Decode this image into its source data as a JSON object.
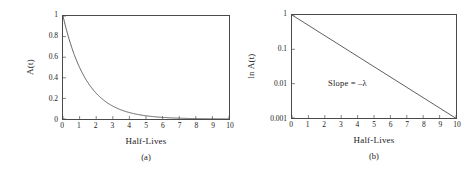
{
  "figure": {
    "background_color": "#ffffff",
    "line_color": "#4a4a4a",
    "text_color": "#1a1a1a"
  },
  "chart_data": [
    {
      "type": "line",
      "panel": "a",
      "caption": "(a)",
      "title": "",
      "xlabel": "Half-Lives",
      "ylabel": "A(t)",
      "xscale": "linear",
      "yscale": "linear",
      "xlim": [
        0,
        10
      ],
      "ylim": [
        0,
        1
      ],
      "grid": false,
      "legend": "none",
      "xticks": [
        "0",
        "1",
        "2",
        "3",
        "4",
        "5",
        "6",
        "7",
        "8",
        "9",
        "10"
      ],
      "xtick_values": [
        0,
        1,
        2,
        3,
        4,
        5,
        6,
        7,
        8,
        9,
        10
      ],
      "yticks": [
        "0",
        "0.2",
        "0.4",
        "0.6",
        "0.8",
        "1"
      ],
      "ytick_values": [
        0,
        0.2,
        0.4,
        0.6,
        0.8,
        1
      ],
      "series": [
        {
          "name": "A(t) = (1/2)^t",
          "x": [
            0,
            0.5,
            1,
            1.5,
            2,
            2.5,
            3,
            3.5,
            4,
            4.5,
            5,
            5.5,
            6,
            6.5,
            7,
            7.5,
            8,
            8.5,
            9,
            9.5,
            10
          ],
          "values": [
            1,
            0.7071,
            0.5,
            0.3536,
            0.25,
            0.1768,
            0.125,
            0.0884,
            0.0625,
            0.0442,
            0.03125,
            0.0221,
            0.015625,
            0.011,
            0.0078,
            0.0055,
            0.0039,
            0.00276,
            0.00195,
            0.00138,
            0.000977
          ]
        }
      ]
    },
    {
      "type": "line",
      "panel": "b",
      "caption": "(b)",
      "title": "",
      "xlabel": "Half-Lives",
      "ylabel": "ln A(t)",
      "xscale": "linear",
      "yscale": "log",
      "xlim": [
        0,
        10
      ],
      "ylim": [
        0.001,
        1
      ],
      "grid": false,
      "legend": "none",
      "xticks": [
        "0",
        "1",
        "2",
        "3",
        "4",
        "5",
        "6",
        "7",
        "8",
        "9",
        "10"
      ],
      "xtick_values": [
        0,
        1,
        2,
        3,
        4,
        5,
        6,
        7,
        8,
        9,
        10
      ],
      "yticks": [
        "0.001",
        "0.01",
        "0.1",
        "1"
      ],
      "ytick_values": [
        0.001,
        0.01,
        0.1,
        1
      ],
      "annotations": [
        {
          "text": "Slope =  –λ",
          "x": 2.6,
          "y": 0.022
        }
      ],
      "series": [
        {
          "name": "ln A(t)",
          "x": [
            0,
            10
          ],
          "values": [
            1,
            0.000977
          ]
        }
      ]
    }
  ]
}
